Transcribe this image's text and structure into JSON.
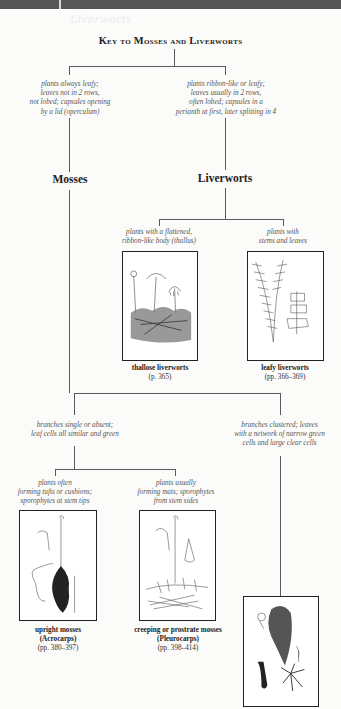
{
  "header": {
    "ghost_text": "Liverworts",
    "title": "Key to Mosses and Liverworts"
  },
  "level1": {
    "mosses_criteria": [
      "plants always leafy;",
      "leaves not in 2 rows,",
      "not lobed; capsules opening",
      "by a lid (operculum)"
    ],
    "liverworts_criteria": [
      "plants ribbon-like or leafy;",
      "leaves usually in 2 rows,",
      "often lobed; capsules in a",
      "perianth at first, later splitting in 4"
    ],
    "mosses_label": "Mosses",
    "liverworts_label": "Liverworts"
  },
  "liverworts": {
    "thallose": {
      "criteria": [
        "plants with a flattened,",
        "ribbon-like body (thallus)"
      ],
      "name": "thallose liverworts",
      "pages": "(p. 365)",
      "illustration": "thallose-liverwort-drawing"
    },
    "leafy": {
      "criteria": [
        "plants with",
        "stems and leaves"
      ],
      "name": "leafy liverworts",
      "pages": "(pp. 366–369)",
      "illustration": "leafy-liverwort-drawing"
    }
  },
  "mosses": {
    "single_branch_criteria": [
      "branches single or absent;",
      "leaf cells all similar and green"
    ],
    "clustered_branch_criteria": [
      "branches clustered; leaves",
      "with a network of narrow green",
      "cells and large clear cells"
    ],
    "acrocarps": {
      "criteria": [
        "plants often",
        "forming tufts or cushions;",
        "sporophytes at stem tips"
      ],
      "name": "upright mosses",
      "subname": "(Acrocarps)",
      "pages": "(pp. 380–397)",
      "illustration": "upright-moss-drawing"
    },
    "pleurocarps": {
      "criteria": [
        "plants usually",
        "forming mats; sporophytes",
        "from stem sides"
      ],
      "name": "creeping or prostrate mosses",
      "subname": "(Pleurocarps)",
      "pages": "(pp. 398–414)",
      "illustration": "creeping-moss-drawing"
    },
    "sphagnum": {
      "illustration": "sphagnum-moss-drawing"
    }
  }
}
